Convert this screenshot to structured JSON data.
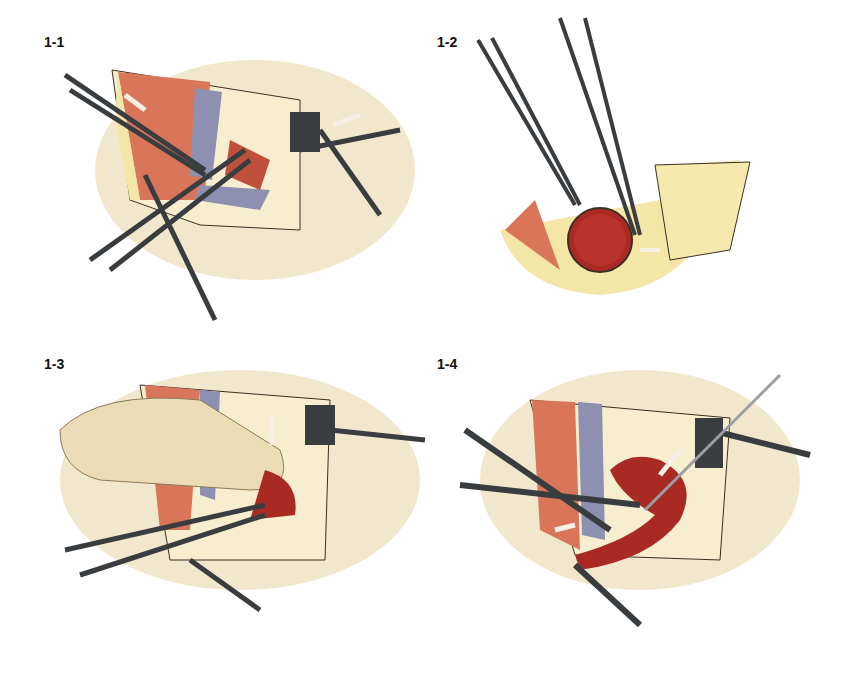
{
  "figure": {
    "panels": [
      {
        "id": "1-1",
        "label": "1-1",
        "description": "Surgical incision with retractors; forceps grasping vessel; artery (red) and vein (blue-gray) exposed; arrows indicate retraction"
      },
      {
        "id": "1-2",
        "label": "1-2",
        "description": "Cross-section of vessel held by forceps; scissors dissecting surrounding fat; double-headed arrow shows separation"
      },
      {
        "id": "1-3",
        "label": "1-3",
        "description": "Finger retracting tissue; clamp on vessel; downward arrow indicating pressure; rake retractor on right"
      },
      {
        "id": "1-4",
        "label": "1-4",
        "description": "Vessel mobilized with clamps and probe; arrows indicate direction of traction"
      }
    ],
    "colors": {
      "skin": "#efe3c4",
      "skin_edge": "#c9b68a",
      "muscle": "#d9765a",
      "artery": "#a82a22",
      "vein": "#8d90b0",
      "fat": "#f4e6a6",
      "instrument": "#6f7478",
      "instrument_dark": "#3a3d40",
      "arrow": "#f5efe6"
    }
  }
}
